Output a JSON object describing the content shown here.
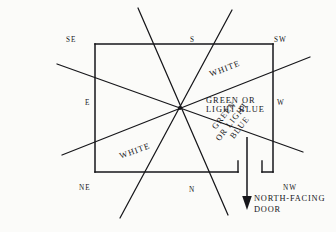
{
  "diagram": {
    "room": {
      "shape": "rectangle",
      "x": 95,
      "y": 44,
      "width": 178,
      "height": 128,
      "door_gap": {
        "start_x": 238,
        "end_x": 262,
        "jamb_height": 11
      }
    },
    "center_point": {
      "x": 180,
      "y": 108
    },
    "stroke_color": "#16161a",
    "background_color": "#fbfbf9",
    "sector_lines": [
      {
        "name": "line-se-nw",
        "x1": 57,
        "y1": 64,
        "x2": 303,
        "y2": 152
      },
      {
        "name": "line-ne-sw",
        "x1": 62,
        "y1": 155,
        "x2": 310,
        "y2": 57
      },
      {
        "name": "line-s-n-left",
        "x1": 138,
        "y1": 8,
        "x2": 228,
        "y2": 215
      },
      {
        "name": "line-s-n-right",
        "x1": 232,
        "y1": 10,
        "x2": 120,
        "y2": 218
      }
    ],
    "arrow": {
      "x": 247,
      "y1": 137,
      "y2": 209,
      "head_width": 9,
      "head_height": 13
    },
    "compass": {
      "se": "SE",
      "s": "S",
      "sw": "SW",
      "e": "E",
      "w": "W",
      "ne": "NE",
      "n": "N",
      "nw": "NW"
    },
    "zones": {
      "white_top": "WHITE",
      "green_right_line1": "GREEN OR",
      "green_right_line2": "LIGHT BLUE",
      "green_lower_line1": "GREEN",
      "green_lower_line2": "OR LIGHT",
      "green_lower_line3": "BLUE",
      "white_bottom": "WHITE"
    },
    "door": {
      "caption_line1": "NORTH-FACING",
      "caption_line2": "DOOR"
    }
  }
}
